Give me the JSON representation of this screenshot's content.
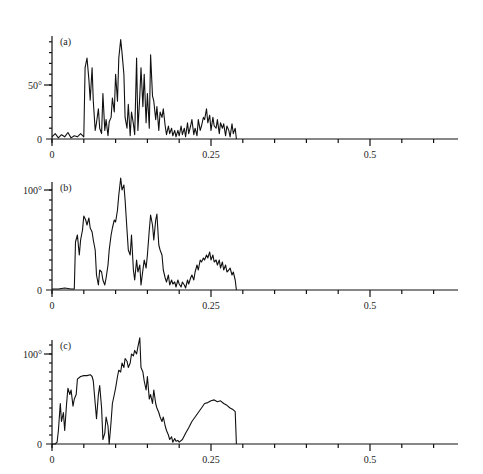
{
  "figure": {
    "x_axis": {
      "ticks": [
        0,
        0.25,
        0.5
      ],
      "tick_labels": [
        "0",
        "0.25",
        "0.5"
      ],
      "minor_step": 0.05,
      "max": 0.64
    }
  },
  "chart_data": [
    {
      "type": "line",
      "panel_label": "(a)",
      "title": "",
      "xlabel": "",
      "ylabel": "",
      "ylim": [
        0,
        92
      ],
      "y_ticks": [
        0,
        50
      ],
      "y_tick_labels": [
        "0",
        "50°"
      ],
      "grid": false,
      "legend": null,
      "series": [
        {
          "name": "a",
          "x": [
            0.0,
            0.005,
            0.01,
            0.015,
            0.02,
            0.025,
            0.03,
            0.035,
            0.04,
            0.045,
            0.05,
            0.052,
            0.055,
            0.058,
            0.06,
            0.063,
            0.065,
            0.068,
            0.07,
            0.073,
            0.075,
            0.078,
            0.08,
            0.083,
            0.085,
            0.088,
            0.09,
            0.093,
            0.095,
            0.098,
            0.1,
            0.103,
            0.105,
            0.108,
            0.11,
            0.113,
            0.115,
            0.118,
            0.12,
            0.123,
            0.125,
            0.128,
            0.13,
            0.133,
            0.135,
            0.138,
            0.14,
            0.143,
            0.145,
            0.148,
            0.15,
            0.153,
            0.155,
            0.158,
            0.16,
            0.163,
            0.165,
            0.168,
            0.17,
            0.173,
            0.175,
            0.178,
            0.18,
            0.183,
            0.185,
            0.188,
            0.19,
            0.193,
            0.195,
            0.198,
            0.2,
            0.203,
            0.205,
            0.208,
            0.21,
            0.213,
            0.215,
            0.218,
            0.22,
            0.223,
            0.225,
            0.228,
            0.23,
            0.233,
            0.235,
            0.238,
            0.24,
            0.243,
            0.245,
            0.248,
            0.25,
            0.253,
            0.255,
            0.258,
            0.26,
            0.263,
            0.265,
            0.268,
            0.27,
            0.273,
            0.275,
            0.278,
            0.28,
            0.283,
            0.285,
            0.288,
            0.29
          ],
          "y": [
            2,
            5,
            1,
            4,
            2,
            6,
            1,
            3,
            2,
            5,
            2,
            66,
            75,
            55,
            36,
            66,
            35,
            8,
            15,
            28,
            10,
            5,
            42,
            8,
            18,
            3,
            16,
            20,
            38,
            25,
            60,
            35,
            75,
            92,
            80,
            60,
            20,
            10,
            32,
            3,
            25,
            14,
            4,
            75,
            8,
            40,
            66,
            30,
            60,
            15,
            42,
            10,
            78,
            40,
            35,
            18,
            30,
            8,
            25,
            20,
            28,
            12,
            4,
            12,
            5,
            10,
            3,
            8,
            2,
            8,
            3,
            12,
            4,
            10,
            2,
            15,
            5,
            12,
            18,
            4,
            10,
            3,
            18,
            8,
            12,
            20,
            18,
            28,
            15,
            22,
            8,
            20,
            12,
            10,
            18,
            5,
            15,
            10,
            14,
            3,
            12,
            8,
            2,
            14,
            5,
            10,
            0
          ],
          "color": "#111111"
        }
      ]
    },
    {
      "type": "line",
      "panel_label": "(b)",
      "title": "",
      "xlabel": "",
      "ylabel": "",
      "ylim": [
        0,
        115
      ],
      "y_ticks": [
        0,
        100
      ],
      "y_tick_labels": [
        "0",
        "100°"
      ],
      "grid": false,
      "legend": null,
      "series": [
        {
          "name": "b",
          "x": [
            0.0,
            0.01,
            0.02,
            0.03,
            0.035,
            0.037,
            0.04,
            0.043,
            0.045,
            0.048,
            0.05,
            0.053,
            0.055,
            0.058,
            0.06,
            0.063,
            0.065,
            0.068,
            0.07,
            0.073,
            0.075,
            0.078,
            0.08,
            0.083,
            0.085,
            0.088,
            0.09,
            0.093,
            0.095,
            0.098,
            0.1,
            0.103,
            0.105,
            0.108,
            0.11,
            0.113,
            0.115,
            0.118,
            0.12,
            0.123,
            0.125,
            0.128,
            0.13,
            0.133,
            0.135,
            0.138,
            0.14,
            0.143,
            0.145,
            0.148,
            0.15,
            0.153,
            0.155,
            0.158,
            0.16,
            0.163,
            0.165,
            0.168,
            0.17,
            0.173,
            0.175,
            0.178,
            0.18,
            0.183,
            0.185,
            0.188,
            0.19,
            0.193,
            0.195,
            0.198,
            0.2,
            0.203,
            0.205,
            0.208,
            0.21,
            0.213,
            0.215,
            0.218,
            0.22,
            0.223,
            0.225,
            0.228,
            0.23,
            0.233,
            0.235,
            0.238,
            0.24,
            0.243,
            0.245,
            0.248,
            0.25,
            0.253,
            0.255,
            0.258,
            0.26,
            0.263,
            0.265,
            0.268,
            0.27,
            0.273,
            0.275,
            0.278,
            0.28,
            0.283,
            0.285,
            0.288,
            0.29
          ],
          "y": [
            1,
            1,
            2,
            1,
            1,
            48,
            55,
            35,
            50,
            60,
            74,
            70,
            65,
            72,
            62,
            58,
            50,
            40,
            15,
            5,
            20,
            18,
            10,
            5,
            12,
            25,
            40,
            55,
            62,
            70,
            68,
            80,
            95,
            112,
            100,
            105,
            90,
            60,
            40,
            35,
            55,
            20,
            10,
            30,
            18,
            25,
            5,
            20,
            30,
            22,
            35,
            60,
            75,
            65,
            50,
            70,
            76,
            45,
            40,
            35,
            20,
            12,
            8,
            15,
            5,
            10,
            6,
            8,
            3,
            10,
            6,
            3,
            8,
            5,
            2,
            10,
            6,
            12,
            15,
            10,
            18,
            25,
            20,
            30,
            28,
            32,
            30,
            35,
            32,
            38,
            30,
            35,
            28,
            30,
            25,
            30,
            22,
            28,
            20,
            25,
            18,
            20,
            22,
            15,
            18,
            10,
            0
          ],
          "color": "#111111"
        }
      ]
    },
    {
      "type": "line",
      "panel_label": "(c)",
      "title": "",
      "xlabel": "",
      "ylabel": "",
      "ylim": [
        0,
        120
      ],
      "y_ticks": [
        0,
        100
      ],
      "y_tick_labels": [
        "0",
        "100°"
      ],
      "grid": false,
      "legend": null,
      "series": [
        {
          "name": "c",
          "x": [
            0.0,
            0.005,
            0.008,
            0.01,
            0.013,
            0.015,
            0.018,
            0.02,
            0.023,
            0.025,
            0.028,
            0.03,
            0.033,
            0.035,
            0.038,
            0.04,
            0.045,
            0.05,
            0.055,
            0.06,
            0.063,
            0.065,
            0.068,
            0.07,
            0.073,
            0.075,
            0.078,
            0.08,
            0.083,
            0.085,
            0.088,
            0.09,
            0.093,
            0.095,
            0.098,
            0.1,
            0.103,
            0.105,
            0.108,
            0.11,
            0.113,
            0.115,
            0.118,
            0.12,
            0.123,
            0.125,
            0.128,
            0.13,
            0.133,
            0.135,
            0.138,
            0.14,
            0.143,
            0.145,
            0.148,
            0.15,
            0.153,
            0.155,
            0.158,
            0.16,
            0.163,
            0.165,
            0.168,
            0.17,
            0.173,
            0.175,
            0.178,
            0.18,
            0.183,
            0.185,
            0.188,
            0.19,
            0.193,
            0.195,
            0.198,
            0.2,
            0.205,
            0.21,
            0.215,
            0.22,
            0.225,
            0.23,
            0.235,
            0.24,
            0.245,
            0.25,
            0.255,
            0.26,
            0.265,
            0.27,
            0.275,
            0.28,
            0.285,
            0.288,
            0.29
          ],
          "y": [
            0,
            0,
            2,
            15,
            45,
            25,
            35,
            15,
            45,
            62,
            55,
            60,
            42,
            50,
            55,
            72,
            75,
            76,
            76,
            77,
            75,
            70,
            45,
            28,
            55,
            65,
            40,
            5,
            12,
            30,
            20,
            0,
            25,
            45,
            55,
            62,
            75,
            82,
            80,
            90,
            85,
            95,
            92,
            85,
            90,
            100,
            98,
            104,
            100,
            108,
            118,
            85,
            80,
            70,
            60,
            75,
            50,
            55,
            45,
            60,
            45,
            40,
            35,
            30,
            25,
            30,
            20,
            15,
            10,
            5,
            8,
            2,
            6,
            3,
            4,
            2,
            5,
            12,
            18,
            25,
            30,
            35,
            40,
            45,
            46,
            48,
            49,
            47,
            48,
            45,
            43,
            40,
            38,
            36,
            0
          ],
          "color": "#111111"
        }
      ]
    }
  ]
}
